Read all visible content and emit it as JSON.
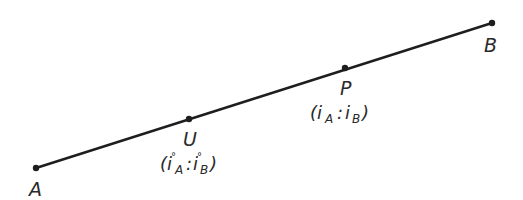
{
  "diagram": {
    "line": {
      "from": "A",
      "to": "B",
      "color": "#1e1e1e"
    },
    "points": [
      {
        "id": "A",
        "label": "A",
        "x": 36,
        "y": 168
      },
      {
        "id": "U",
        "label": "U",
        "x": 189,
        "y": 119,
        "coords": "(i°A : i°B)"
      },
      {
        "id": "P",
        "label": "P",
        "x": 345,
        "y": 68,
        "coords": "(iA : iB)"
      },
      {
        "id": "B",
        "label": "B",
        "x": 492,
        "y": 23
      }
    ],
    "labels": {
      "A": "A",
      "U": "U",
      "P": "P",
      "B": "B",
      "U_open": "(i",
      "U_sub_a": "A",
      "U_sup_a": "°",
      "U_colon": ":",
      "U_i2": "i",
      "U_sub_b": "B",
      "U_sup_b": "°",
      "U_close": ")",
      "P_open": "(i",
      "P_sub_a": "A",
      "P_colon": ":",
      "P_i2": "i",
      "P_sub_b": "B",
      "P_close": ")"
    }
  }
}
